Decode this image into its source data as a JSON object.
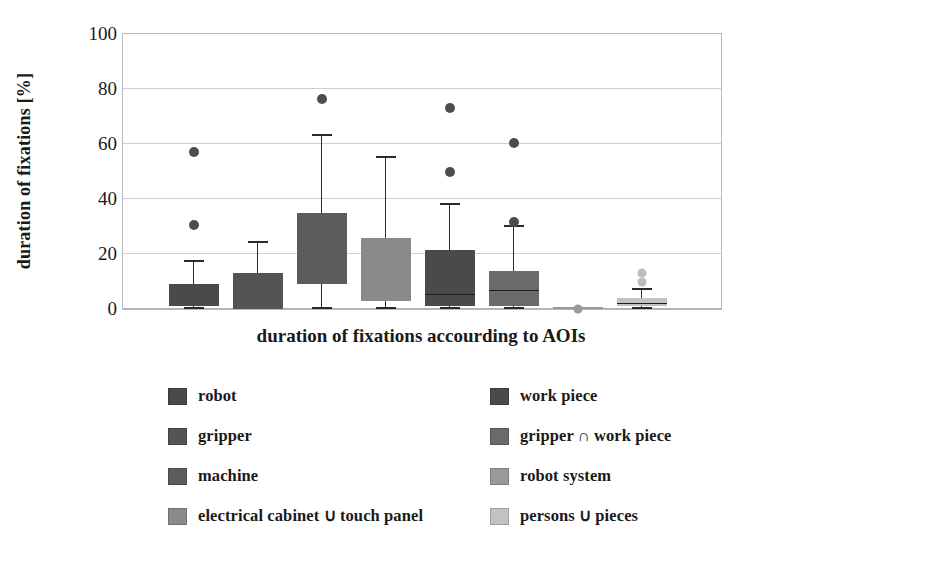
{
  "chart_data": {
    "type": "box",
    "title": "",
    "xlabel": "duration of fixations accourding to AOIs",
    "ylabel": "duration of fixations [%]",
    "ylim": [
      0,
      100
    ],
    "yticks": [
      0,
      20,
      40,
      60,
      80,
      100
    ],
    "ytick_labels": [
      "0",
      "20",
      "40",
      "60",
      "80",
      "100"
    ],
    "grid": "horizontal",
    "legend_position": "bottom",
    "legend_columns": 2,
    "categories": [
      "robot",
      "gripper",
      "machine",
      "electrical cabinet ∪ touch panel",
      "work piece",
      "gripper ∩ work piece",
      "robot system",
      "persons ∪ pieces"
    ],
    "boxes": [
      {
        "name": "robot",
        "color": "#4a4a4a",
        "q1": 1.0,
        "median": 1.0,
        "q3": 9.0,
        "whisker_low": 0.0,
        "whisker_high": 17.0,
        "outliers": [
          30.5,
          57.0
        ]
      },
      {
        "name": "gripper",
        "color": "#545454",
        "q1": 0.0,
        "median": 0.0,
        "q3": 13.0,
        "whisker_low": 0.0,
        "whisker_high": 24.0,
        "outliers": []
      },
      {
        "name": "machine",
        "color": "#5c5c5c",
        "q1": 9.0,
        "median": 9.0,
        "q3": 35.0,
        "whisker_low": 0.0,
        "whisker_high": 63.0,
        "outliers": [
          76.5
        ]
      },
      {
        "name": "electrical cabinet ∪ touch panel",
        "color": "#8a8a8a",
        "q1": 3.0,
        "median": 3.0,
        "q3": 26.0,
        "whisker_low": 0.0,
        "whisker_high": 55.0,
        "outliers": []
      },
      {
        "name": "work piece",
        "color": "#4a4a4a",
        "q1": 1.0,
        "median": 5.0,
        "q3": 21.5,
        "whisker_low": 0.0,
        "whisker_high": 38.0,
        "outliers": [
          50.0,
          73.0
        ]
      },
      {
        "name": "gripper ∩ work piece",
        "color": "#6a6a6a",
        "q1": 1.0,
        "median": 6.5,
        "q3": 14.0,
        "whisker_low": 0.0,
        "whisker_high": 30.0,
        "outliers": [
          31.5,
          60.5
        ]
      },
      {
        "name": "robot system",
        "color": "#9a9a9a",
        "q1": 0.0,
        "median": 0.0,
        "q3": 0.0,
        "whisker_low": 0.0,
        "whisker_high": 0.0,
        "outliers": [
          0.0
        ]
      },
      {
        "name": "persons ∪ pieces",
        "color": "#c2c2c2",
        "q1": 1.0,
        "median": 2.0,
        "q3": 4.0,
        "whisker_low": 0.0,
        "whisker_high": 7.0,
        "outliers": [
          10.0,
          13.0
        ]
      }
    ]
  },
  "axes": {
    "ylabel": "duration of fixations [%]",
    "xlabel": "duration of fixations accourding to AOIs",
    "ytick_labels": [
      "100",
      "80",
      "60",
      "40",
      "20",
      "0"
    ]
  },
  "legend": {
    "rows": [
      {
        "left": {
          "label": "robot",
          "color": "#4a4a4a"
        },
        "right": {
          "label": "work piece",
          "color": "#4a4a4a"
        }
      },
      {
        "left": {
          "label": "gripper",
          "color": "#545454"
        },
        "right": {
          "label": "gripper ∩ work piece",
          "color": "#6a6a6a"
        }
      },
      {
        "left": {
          "label": "machine",
          "color": "#5c5c5c"
        },
        "right": {
          "label": "robot system",
          "color": "#9a9a9a"
        }
      },
      {
        "left": {
          "label": "electrical cabinet ∪ touch panel",
          "color": "#8a8a8a"
        },
        "right": {
          "label": "persons ∪ pieces",
          "color": "#c2c2c2"
        }
      }
    ]
  }
}
